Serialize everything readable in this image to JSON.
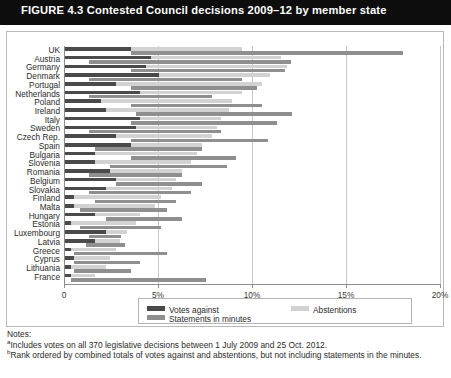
{
  "figure": {
    "label": "FIGURE 4.3",
    "title": "Contested Council decisions 2009–12 by member state",
    "title_full": "FIGURE 4.3  Contested Council decisions 2009–12 by member state"
  },
  "legend": {
    "items": [
      {
        "label": "Votes against",
        "color": "#4a4a4a",
        "key": "votes_against"
      },
      {
        "label": "Abstentions",
        "color": "#d2d2d2",
        "key": "abstentions"
      },
      {
        "label": "Statements in minutes",
        "color": "#8f8f8f",
        "key": "statements"
      }
    ]
  },
  "notes": {
    "heading": "Notes:",
    "a_marker": "a",
    "a_text": "Includes votes on all 370 legislative decisions between 1 July 2009 and 25 Oct. 2012.",
    "b_marker": "b",
    "b_text": "Rank ordered by combined totals of votes against and abstentions, but not including statements in the minutes."
  },
  "chart_data": {
    "type": "bar",
    "orientation": "horizontal",
    "stacked": true,
    "title": "Contested Council decisions 2009–12 by member state",
    "xlabel": "",
    "ylabel": "",
    "xlim": [
      0,
      20
    ],
    "xticks": [
      0,
      5,
      10,
      15,
      20
    ],
    "xtick_labels": [
      "0",
      "5%",
      "10%",
      "15%",
      "20%"
    ],
    "grid": true,
    "legend_position": "bottom",
    "categories": [
      "UK",
      "Austria",
      "Germany",
      "Denmark",
      "Portugal",
      "Netherlands",
      "Poland",
      "Ireland",
      "Italy",
      "Sweden",
      "Czech Rep.",
      "Spain",
      "Bulgaria",
      "Slovenia",
      "Romania",
      "Belgium",
      "Slovakia",
      "Finland",
      "Malta",
      "Hungary",
      "Estonia",
      "Luxembourg",
      "Latvia",
      "Greece",
      "Cyprus",
      "Lithuania",
      "France"
    ],
    "series": [
      {
        "name": "Votes against",
        "color": "#4a4a4a",
        "values": [
          3.5,
          4.6,
          4.3,
          5.0,
          2.7,
          4.0,
          1.9,
          2.2,
          4.0,
          3.8,
          2.7,
          3.5,
          1.6,
          1.6,
          2.4,
          2.7,
          2.2,
          0.5,
          0.5,
          1.6,
          0.3,
          2.2,
          1.6,
          0.3,
          0.5,
          0.3,
          0.3
        ]
      },
      {
        "name": "Abstentions",
        "color": "#d2d2d2",
        "values": [
          5.9,
          6.9,
          7.5,
          5.9,
          7.8,
          5.4,
          7.0,
          6.5,
          4.3,
          4.3,
          5.1,
          3.8,
          5.4,
          5.1,
          3.8,
          3.2,
          3.5,
          4.6,
          4.3,
          2.4,
          3.5,
          1.1,
          1.3,
          2.4,
          1.9,
          1.9,
          1.3
        ]
      },
      {
        "name": "Statements in minutes",
        "color": "#8f8f8f",
        "values": [
          18.0,
          12.0,
          11.7,
          9.4,
          10.2,
          7.8,
          10.5,
          12.1,
          11.3,
          8.3,
          10.8,
          7.3,
          9.1,
          8.6,
          6.2,
          7.3,
          6.7,
          5.9,
          5.4,
          6.2,
          5.1,
          3.0,
          3.2,
          5.4,
          4.0,
          3.5,
          7.5
        ]
      }
    ],
    "series_offsets": {
      "Statements in minutes": [
        3.5,
        1.3,
        3.5,
        1.3,
        3.5,
        1.3,
        3.5,
        3.8,
        3.5,
        1.3,
        3.5,
        1.6,
        3.5,
        2.4,
        1.3,
        2.7,
        1.3,
        1.6,
        0.8,
        2.2,
        0.8,
        1.3,
        1.1,
        0.5,
        0.5,
        0.5,
        0.3
      ]
    }
  }
}
